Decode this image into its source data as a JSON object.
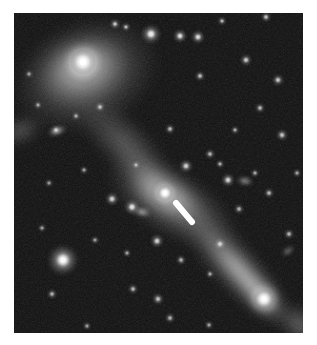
{
  "page": {
    "width": 317,
    "height": 345,
    "background_color": "#ffffff"
  },
  "image": {
    "name": "astronomy-sky-image",
    "frame": {
      "x": 14,
      "y": 13,
      "width": 289,
      "height": 320
    },
    "background_color": "#060606",
    "description": "Grayscale deep-sky astronomical exposure showing two interacting diffuse galaxies connected by a faint bridge, a bright central nucleus with a short white bar marker, an edge-on elongated galaxy at lower right, and numerous point-like stars on a dark noisy background.",
    "colors": {
      "sky": "#070707",
      "faint_nebulosity": "#3a3a3a",
      "mid_nebulosity": "#6e6e6e",
      "bright_nebulosity": "#a9a9a9",
      "star_core": "#ffffff",
      "marker": "#ffffff"
    }
  },
  "chart_data": {
    "type": "scatter",
    "title": "",
    "xlabel": "",
    "ylabel": "",
    "xlim": [
      0,
      289
    ],
    "ylim": [
      0,
      320
    ],
    "grid": false,
    "legend_position": "none",
    "nebulosity": [
      {
        "name": "upper-left-galaxy-halo",
        "cx": 72,
        "cy": 62,
        "rx": 78,
        "ry": 56,
        "rotation": -22,
        "peak": 0.56
      },
      {
        "name": "upper-left-galaxy-inner",
        "cx": 68,
        "cy": 55,
        "rx": 50,
        "ry": 36,
        "rotation": -18,
        "peak": 0.68
      },
      {
        "name": "upper-left-galaxy-core-glow",
        "cx": 69,
        "cy": 49,
        "rx": 26,
        "ry": 20,
        "rotation": -15,
        "peak": 0.86
      },
      {
        "name": "tidal-bridge-upper",
        "cx": 110,
        "cy": 130,
        "rx": 62,
        "ry": 26,
        "rotation": 42,
        "peak": 0.4
      },
      {
        "name": "tidal-bridge-mid",
        "cx": 140,
        "cy": 168,
        "rx": 52,
        "ry": 22,
        "rotation": 40,
        "peak": 0.44
      },
      {
        "name": "central-galaxy-halo",
        "cx": 158,
        "cy": 190,
        "rx": 76,
        "ry": 34,
        "rotation": 30,
        "peak": 0.58
      },
      {
        "name": "central-galaxy-inner",
        "cx": 152,
        "cy": 182,
        "rx": 42,
        "ry": 22,
        "rotation": 25,
        "peak": 0.7
      },
      {
        "name": "lower-right-streak-outer",
        "cx": 220,
        "cy": 252,
        "rx": 86,
        "ry": 25,
        "rotation": 48,
        "peak": 0.58
      },
      {
        "name": "lower-right-streak-inner",
        "cx": 231,
        "cy": 264,
        "rx": 64,
        "ry": 15,
        "rotation": 48,
        "peak": 0.76
      },
      {
        "name": "lower-right-knot-glow",
        "cx": 248,
        "cy": 283,
        "rx": 26,
        "ry": 16,
        "rotation": 48,
        "peak": 0.92
      },
      {
        "name": "left-edge-wisp",
        "cx": 6,
        "cy": 118,
        "rx": 24,
        "ry": 14,
        "rotation": -20,
        "peak": 0.42
      },
      {
        "name": "right-edge-wisp",
        "cx": 286,
        "cy": 312,
        "rx": 26,
        "ry": 18,
        "rotation": 45,
        "peak": 0.5
      }
    ],
    "point_sources": [
      {
        "x": 69,
        "y": 49,
        "r": 13,
        "b": 1.0,
        "name": "upper-left-bright-core"
      },
      {
        "x": 151,
        "y": 180,
        "r": 8.5,
        "b": 1.0,
        "name": "central-nucleus"
      },
      {
        "x": 49,
        "y": 247,
        "r": 10,
        "b": 0.97,
        "name": "bright-field-star-lower-left"
      },
      {
        "x": 250,
        "y": 286,
        "r": 11,
        "b": 0.95,
        "name": "lower-right-bright-knot"
      },
      {
        "x": 137,
        "y": 21,
        "r": 6.5,
        "b": 0.85,
        "name": "star-top-center"
      },
      {
        "x": 166,
        "y": 23,
        "r": 4.5,
        "b": 0.78,
        "name": "star-top-a"
      },
      {
        "x": 184,
        "y": 24,
        "r": 4.5,
        "b": 0.76,
        "name": "star-top-b"
      },
      {
        "x": 101,
        "y": 11,
        "r": 3.5,
        "b": 0.62,
        "name": "star-top-c"
      },
      {
        "x": 112,
        "y": 14,
        "r": 3.0,
        "b": 0.58,
        "name": "star-top-d"
      },
      {
        "x": 208,
        "y": 8,
        "r": 3.0,
        "b": 0.55,
        "name": "star-top-e"
      },
      {
        "x": 252,
        "y": 4,
        "r": 3.5,
        "b": 0.6,
        "name": "star-top-f"
      },
      {
        "x": 232,
        "y": 47,
        "r": 4.0,
        "b": 0.66,
        "name": "star-ur-a"
      },
      {
        "x": 186,
        "y": 63,
        "r": 3.5,
        "b": 0.58,
        "name": "star-ur-b"
      },
      {
        "x": 264,
        "y": 67,
        "r": 4.0,
        "b": 0.64,
        "name": "star-ur-c"
      },
      {
        "x": 246,
        "y": 95,
        "r": 3.5,
        "b": 0.56,
        "name": "star-ur-d"
      },
      {
        "x": 268,
        "y": 122,
        "r": 4.0,
        "b": 0.62,
        "name": "star-ur-e"
      },
      {
        "x": 221,
        "y": 117,
        "r": 3.0,
        "b": 0.5,
        "name": "star-ur-f"
      },
      {
        "x": 156,
        "y": 116,
        "r": 3.5,
        "b": 0.55,
        "name": "star-mid-a"
      },
      {
        "x": 196,
        "y": 141,
        "r": 3.5,
        "b": 0.54,
        "name": "star-mid-b"
      },
      {
        "x": 172,
        "y": 153,
        "r": 4.5,
        "b": 0.7,
        "name": "star-mid-c"
      },
      {
        "x": 206,
        "y": 151,
        "r": 3.0,
        "b": 0.52,
        "name": "star-mid-d"
      },
      {
        "x": 122,
        "y": 152,
        "r": 3.0,
        "b": 0.48,
        "name": "star-mid-e"
      },
      {
        "x": 70,
        "y": 157,
        "r": 3.0,
        "b": 0.46,
        "name": "star-mid-f"
      },
      {
        "x": 214,
        "y": 167,
        "r": 4.5,
        "b": 0.72,
        "name": "star-mid-g"
      },
      {
        "x": 241,
        "y": 160,
        "r": 3.0,
        "b": 0.5,
        "name": "star-mid-h"
      },
      {
        "x": 98,
        "y": 186,
        "r": 4.5,
        "b": 0.7,
        "name": "star-left-of-nucleus"
      },
      {
        "x": 118,
        "y": 194,
        "r": 5.0,
        "b": 0.8,
        "name": "star-near-nucleus"
      },
      {
        "x": 255,
        "y": 180,
        "r": 3.5,
        "b": 0.56,
        "name": "star-right-a"
      },
      {
        "x": 283,
        "y": 160,
        "r": 3.0,
        "b": 0.48,
        "name": "star-right-b"
      },
      {
        "x": 225,
        "y": 196,
        "r": 3.5,
        "b": 0.52,
        "name": "star-right-c"
      },
      {
        "x": 143,
        "y": 228,
        "r": 4.5,
        "b": 0.7,
        "name": "star-below-nucleus"
      },
      {
        "x": 113,
        "y": 240,
        "r": 3.0,
        "b": 0.48,
        "name": "star-ll-a"
      },
      {
        "x": 167,
        "y": 247,
        "r": 3.5,
        "b": 0.52,
        "name": "star-ll-b"
      },
      {
        "x": 81,
        "y": 227,
        "r": 3.0,
        "b": 0.45,
        "name": "star-ll-c"
      },
      {
        "x": 28,
        "y": 215,
        "r": 3.0,
        "b": 0.46,
        "name": "star-ll-d"
      },
      {
        "x": 38,
        "y": 281,
        "r": 3.5,
        "b": 0.52,
        "name": "star-bottom-a"
      },
      {
        "x": 119,
        "y": 276,
        "r": 3.5,
        "b": 0.55,
        "name": "star-bottom-b"
      },
      {
        "x": 144,
        "y": 286,
        "r": 4.0,
        "b": 0.6,
        "name": "star-bottom-c"
      },
      {
        "x": 156,
        "y": 305,
        "r": 3.5,
        "b": 0.54,
        "name": "star-bottom-d"
      },
      {
        "x": 195,
        "y": 312,
        "r": 3.0,
        "b": 0.48,
        "name": "star-bottom-e"
      },
      {
        "x": 73,
        "y": 313,
        "r": 3.0,
        "b": 0.46,
        "name": "star-bottom-f"
      },
      {
        "x": 206,
        "y": 231,
        "r": 4.0,
        "b": 0.62,
        "name": "star-lr-a"
      },
      {
        "x": 196,
        "y": 261,
        "r": 3.0,
        "b": 0.48,
        "name": "star-lr-b"
      },
      {
        "x": 275,
        "y": 221,
        "r": 3.5,
        "b": 0.54,
        "name": "star-lr-c"
      },
      {
        "x": 42,
        "y": 117,
        "r": 3.5,
        "b": 0.56,
        "name": "star-left-a"
      },
      {
        "x": 24,
        "y": 92,
        "r": 3.0,
        "b": 0.46,
        "name": "star-left-b"
      },
      {
        "x": 15,
        "y": 61,
        "r": 3.0,
        "b": 0.44,
        "name": "star-left-c"
      },
      {
        "x": 86,
        "y": 94,
        "r": 3.5,
        "b": 0.55,
        "name": "star-ulg-a"
      },
      {
        "x": 62,
        "y": 103,
        "r": 3.0,
        "b": 0.48,
        "name": "star-ulg-b"
      },
      {
        "x": 35,
        "y": 170,
        "r": 3.0,
        "b": 0.44,
        "name": "star-left-d"
      }
    ],
    "elongated_sources": [
      {
        "x": 43,
        "y": 118,
        "rx": 11,
        "ry": 4,
        "rot": -18,
        "b": 0.72,
        "name": "edge-on-galaxy-left"
      },
      {
        "x": 231,
        "y": 168,
        "rx": 9,
        "ry": 4,
        "rot": 8,
        "b": 0.66,
        "name": "edge-on-galaxy-right"
      },
      {
        "x": 274,
        "y": 238,
        "rx": 8,
        "ry": 3,
        "rot": -35,
        "b": 0.58,
        "name": "edge-on-galaxy-lr"
      },
      {
        "x": 128,
        "y": 199,
        "rx": 10,
        "ry": 4,
        "rot": 12,
        "b": 0.74,
        "name": "elongated-near-nucleus"
      }
    ],
    "marker": {
      "name": "white-bar-marker",
      "x1": 162,
      "y1": 190,
      "x2": 178,
      "y2": 209,
      "width": 6,
      "color": "#ffffff"
    }
  },
  "labels": {
    "caption": ""
  }
}
